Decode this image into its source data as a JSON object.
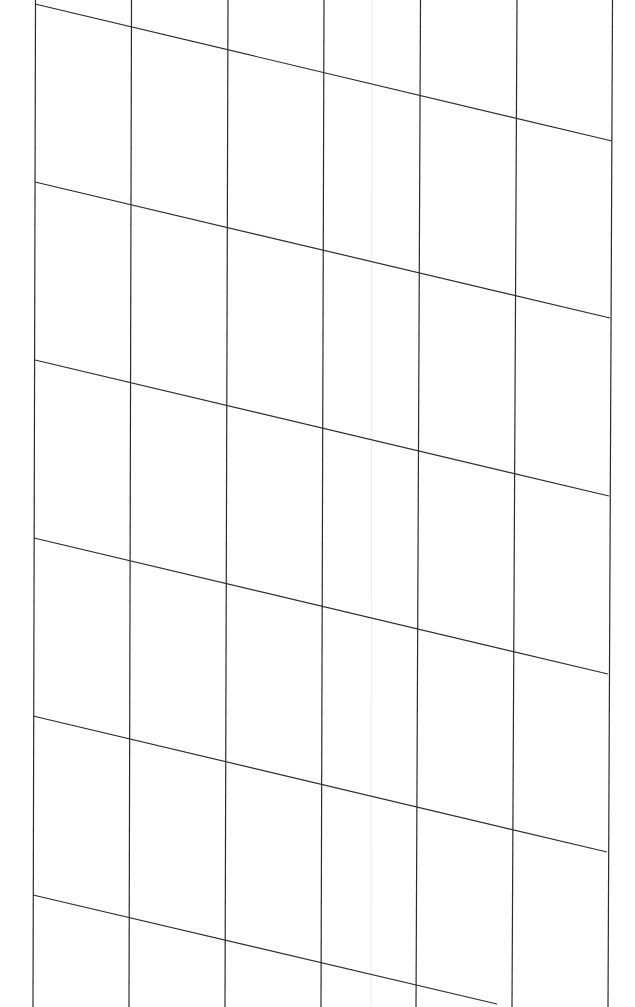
{
  "canvas": {
    "width": 635,
    "height": 1007,
    "background": "#ffffff"
  },
  "grid": {
    "line_color": "#2b2b2b",
    "line_width": 1.2,
    "vertical_lines": [
      {
        "x1": 35.5,
        "y1": 0,
        "x2": 33,
        "y2": 1007
      },
      {
        "x1": 131.5,
        "y1": 0,
        "x2": 129,
        "y2": 1007
      },
      {
        "x1": 228,
        "y1": 0,
        "x2": 225,
        "y2": 1007
      },
      {
        "x1": 324,
        "y1": 0,
        "x2": 321,
        "y2": 1007
      },
      {
        "x1": 420.5,
        "y1": 0,
        "x2": 416,
        "y2": 1007
      },
      {
        "x1": 517,
        "y1": 0,
        "x2": 512,
        "y2": 1007
      },
      {
        "x1": 612.5,
        "y1": 0,
        "x2": 608,
        "y2": 1007
      }
    ],
    "slanted_lines": [
      {
        "x1": 35,
        "y1": 4,
        "x2": 612,
        "y2": 141
      },
      {
        "x1": 35,
        "y1": 182,
        "x2": 610,
        "y2": 318
      },
      {
        "x1": 35,
        "y1": 360,
        "x2": 609,
        "y2": 496
      },
      {
        "x1": 34,
        "y1": 538,
        "x2": 608,
        "y2": 674
      },
      {
        "x1": 33,
        "y1": 716,
        "x2": 607,
        "y2": 852
      },
      {
        "x1": 33,
        "y1": 895,
        "x2": 497,
        "y2": 1004
      }
    ],
    "faint_lines": [
      {
        "x1": 372,
        "y1": 0,
        "x2": 371,
        "y2": 1007,
        "color": "#ececec"
      }
    ]
  }
}
